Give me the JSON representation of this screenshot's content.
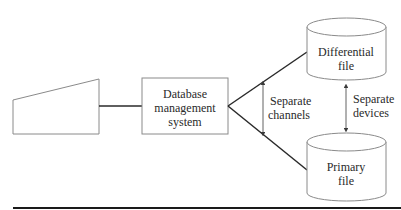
{
  "diagram": {
    "terminal": {
      "shape": "trapezoid"
    },
    "dbms": {
      "lines": [
        "Database",
        "management",
        "system"
      ]
    },
    "differential_file": {
      "lines": [
        "Differential",
        "file"
      ]
    },
    "primary_file": {
      "lines": [
        "Primary",
        "file"
      ]
    },
    "channels_label": {
      "lines": [
        "Separate",
        "channels"
      ]
    },
    "devices_label": {
      "lines": [
        "Separate",
        "devices"
      ]
    }
  },
  "colors": {
    "stroke": "#8a8a8a",
    "connector": "#2a2a2a",
    "text": "#2a2a2a"
  }
}
